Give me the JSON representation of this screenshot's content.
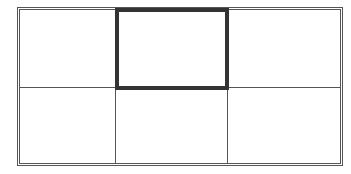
{
  "table": {
    "rows": 2,
    "columns": 3,
    "cells": [
      [
        {
          "text": ""
        },
        {
          "text": "",
          "selected": true
        },
        {
          "text": ""
        }
      ],
      [
        {
          "text": ""
        },
        {
          "text": ""
        },
        {
          "text": ""
        }
      ]
    ],
    "selected_cell": {
      "row": 0,
      "column": 1
    },
    "colors": {
      "border": "#555555",
      "selection_border": "#333333",
      "background": "#ffffff"
    }
  }
}
